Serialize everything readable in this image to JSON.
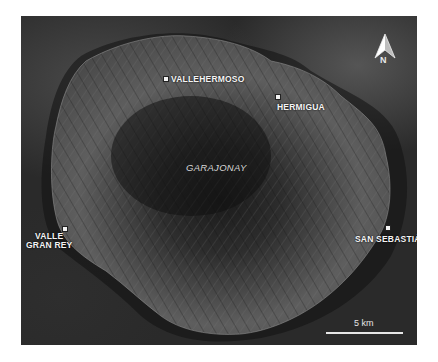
{
  "map": {
    "region_label": "GARAJONAY",
    "places": [
      {
        "name": "VALLEHERMOSO"
      },
      {
        "name": "HERMIGUA"
      },
      {
        "name": "VALLE",
        "name_line2": "GRAN REY"
      },
      {
        "name": "SAN SEBASTIÁN"
      }
    ],
    "north_arrow": {
      "icon": "north-arrow-icon",
      "label": "N"
    },
    "scale_bar": {
      "label": "5 km"
    },
    "colors": {
      "ocean": "#2a2a2a",
      "land": "#5a5a5a",
      "label": "#f4f4f4"
    }
  }
}
